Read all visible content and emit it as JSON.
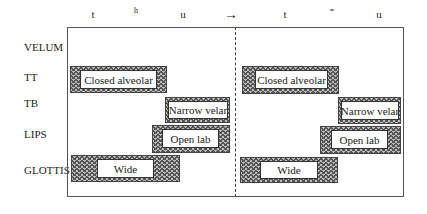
{
  "top_segments_left": [
    "t",
    "h",
    "u"
  ],
  "top_segments_right": [
    "t",
    "=",
    "u"
  ],
  "arrow": "→",
  "tiers": {
    "velum": "VELUM",
    "tt": "TT",
    "tb": "TB",
    "lips": "LIPS",
    "glottis": "GLOTTIS"
  },
  "left_panel": {
    "tt": "Closed alveolar",
    "tb": "Narrow velar",
    "lips": "Open lab",
    "glottis": "Wide"
  },
  "right_panel": {
    "tt": "Closed alveolar",
    "tb": "Narrow velar",
    "lips": "Open lab",
    "glottis": "Wide"
  }
}
